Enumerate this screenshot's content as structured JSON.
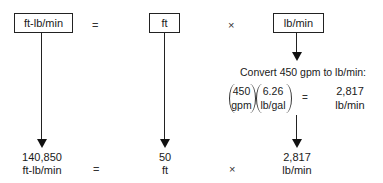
{
  "top_row": {
    "box1": "ft-lb/min",
    "equals": "=",
    "box2": "ft",
    "times": "×",
    "box3": "lb/min"
  },
  "conversion": {
    "title": "Convert 450 gpm to lb/min:",
    "factor1": {
      "num": "450",
      "den": "gpm"
    },
    "factor2": {
      "num": "6.26",
      "den": "lb/gal"
    },
    "equals": "=",
    "result": {
      "value": "2,817",
      "unit": "lb/min"
    }
  },
  "bottom_row": {
    "term1": {
      "value": "140,850",
      "unit": "ft-lb/min"
    },
    "equals": "=",
    "term2": {
      "value": "50",
      "unit": "ft"
    },
    "times": "×",
    "term3": {
      "value": "2,817",
      "unit": "lb/min"
    }
  }
}
